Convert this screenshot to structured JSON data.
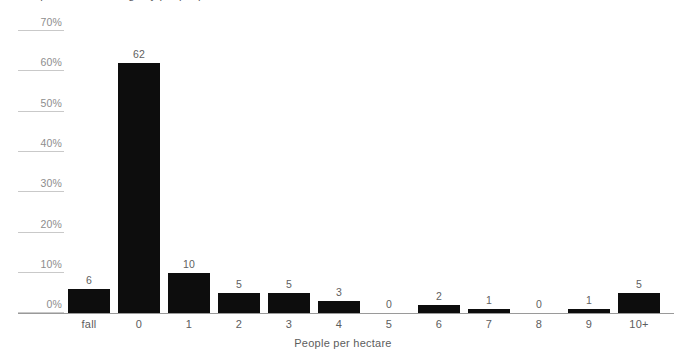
{
  "chart_data": {
    "type": "bar",
    "title": "Proportion of dwellings by people per hectare",
    "xlabel": "People per hectare",
    "ylabel": "",
    "categories": [
      "fall",
      "0",
      "1",
      "2",
      "3",
      "4",
      "5",
      "6",
      "7",
      "8",
      "9",
      "10+"
    ],
    "values": [
      6,
      62,
      10,
      5,
      5,
      3,
      0,
      2,
      1,
      0,
      1,
      5
    ],
    "value_labels": [
      "6",
      "62",
      "10",
      "5",
      "5",
      "3",
      "0",
      "2",
      "1",
      "0",
      "1",
      "5"
    ],
    "ylim": [
      0,
      70
    ],
    "ytick_labels": [
      "0%",
      "10%",
      "20%",
      "30%",
      "40%",
      "50%",
      "60%",
      "70%"
    ],
    "ytick_values": [
      0,
      10,
      20,
      30,
      40,
      50,
      60,
      70
    ],
    "grid": true,
    "legend": false,
    "series": [
      {
        "name": "Share of dwellings",
        "values": [
          6,
          62,
          10,
          5,
          5,
          3,
          0,
          2,
          1,
          0,
          1,
          5
        ]
      }
    ],
    "colors": {
      "bar": "#0d0d0d",
      "gridline": "#c9c9c9",
      "axis": "#9a9a9a",
      "tick_label": "#8d8d8d",
      "value_label": "#5f5f5f",
      "category_label": "#5d5d5d",
      "background": "#ffffff"
    }
  }
}
